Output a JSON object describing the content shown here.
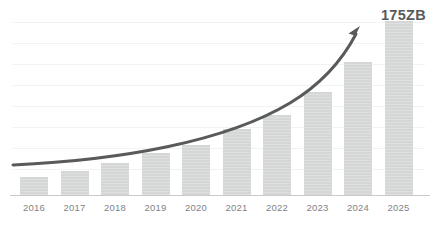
{
  "chart_data": {
    "type": "bar",
    "title": "",
    "subtitle": "",
    "xlabel": "",
    "ylabel": "",
    "unit": "ZB",
    "categories": [
      "2016",
      "2017",
      "2018",
      "2019",
      "2020",
      "2021",
      "2022",
      "2023",
      "2024",
      "2025"
    ],
    "values": [
      19,
      25,
      33,
      43,
      51,
      67,
      81,
      104,
      134,
      175
    ],
    "ylim": [
      0,
      186
    ],
    "grid": true,
    "gridline_count": 8,
    "legend": null,
    "annotations": [
      {
        "name": "value-callout",
        "text": "175ZB",
        "attached_to_category": "2025",
        "color": "#58595b"
      },
      {
        "name": "growth-trend-arrow",
        "shape": "curved-upward-arrow",
        "color": "#595a5c",
        "direction": "up-right"
      }
    ],
    "colors": {
      "bar": "#d5d7d7",
      "arrow": "#595a5c",
      "gridline": "#f1f2f2",
      "axis": "#c9cbcb",
      "tick_label": "#808384",
      "callout": "#58595b",
      "background": "#ffffff"
    },
    "bar_geometry": {
      "baseline_y": 196,
      "bar_width": 28,
      "first_bar_left": 20,
      "slot_width": 40.5,
      "tops": [
        178,
        172,
        165,
        155,
        148,
        133,
        120,
        98,
        70,
        31
      ]
    },
    "gridline_y": [
      22,
      43,
      64,
      85,
      106,
      127,
      148,
      169
    ]
  },
  "axis": {
    "tick_labels": [
      "2016",
      "2017",
      "2018",
      "2019",
      "2020",
      "2021",
      "2022",
      "2023",
      "2024",
      "2025"
    ]
  },
  "callout": {
    "text": "175ZB"
  }
}
